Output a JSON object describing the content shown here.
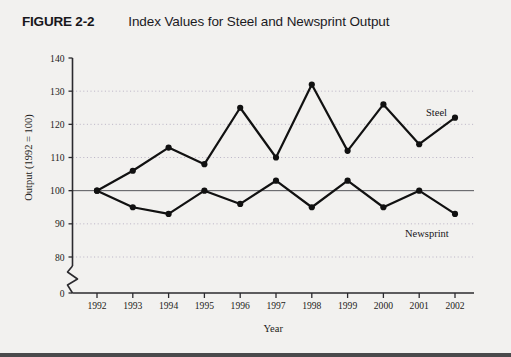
{
  "figure": {
    "number": "FIGURE 2-2",
    "title": "Index Values for Steel and Newsprint Output"
  },
  "chart_data": {
    "type": "line",
    "title": "Index Values for Steel and Newsprint Output",
    "xlabel": "Year",
    "ylabel": "Output (1992 = 100)",
    "categories": [
      "1992",
      "1993",
      "1994",
      "1995",
      "1996",
      "1997",
      "1998",
      "1999",
      "2000",
      "2001",
      "2002"
    ],
    "series": [
      {
        "name": "Steel",
        "values": [
          100,
          106,
          113,
          108,
          125,
          110,
          132,
          112,
          126,
          114,
          122
        ]
      },
      {
        "name": "Newsprint",
        "values": [
          100,
          95,
          93,
          100,
          96,
          103,
          95,
          103,
          95,
          100,
          93
        ]
      }
    ],
    "ylim": [
      80,
      140
    ],
    "y_ticks": [
      "140",
      "130",
      "120",
      "110",
      "100",
      "90",
      "80",
      "0"
    ],
    "y_axis_break": true,
    "grid": "horizontal-dotted",
    "reference_line": 100,
    "legend": "inline-labels",
    "line_color": "#111111",
    "marker_color": "#111111",
    "grid_color": "#b9b2c4",
    "background_color": "#f2f1ef"
  }
}
